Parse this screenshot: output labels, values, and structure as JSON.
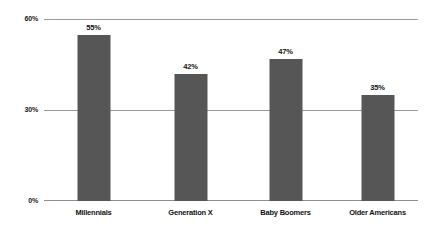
{
  "chart_data": {
    "type": "bar",
    "title": "",
    "subtitle": "",
    "xlabel": "",
    "ylabel": "",
    "categories": [
      "Millennials",
      "Generation X",
      "Baby Boomers",
      "Older Americans"
    ],
    "values": [
      55,
      42,
      47,
      35
    ],
    "data_labels": [
      "55%",
      "42%",
      "47%",
      "35%"
    ],
    "ylim": [
      0,
      60
    ],
    "yticks": [
      0,
      30,
      60
    ],
    "ytick_labels": [
      "0%",
      "30%",
      "60%"
    ],
    "grid": true,
    "legend": false,
    "legend_position": "none",
    "series": [
      {
        "name": "",
        "values": [
          55,
          42,
          47,
          35
        ],
        "color": "#565656"
      }
    ],
    "colors": {
      "bar": "#565656",
      "gridline": "#9a9a9a",
      "baseline": "#8f8f8f",
      "text": "#111111",
      "background": "#ffffff"
    }
  }
}
